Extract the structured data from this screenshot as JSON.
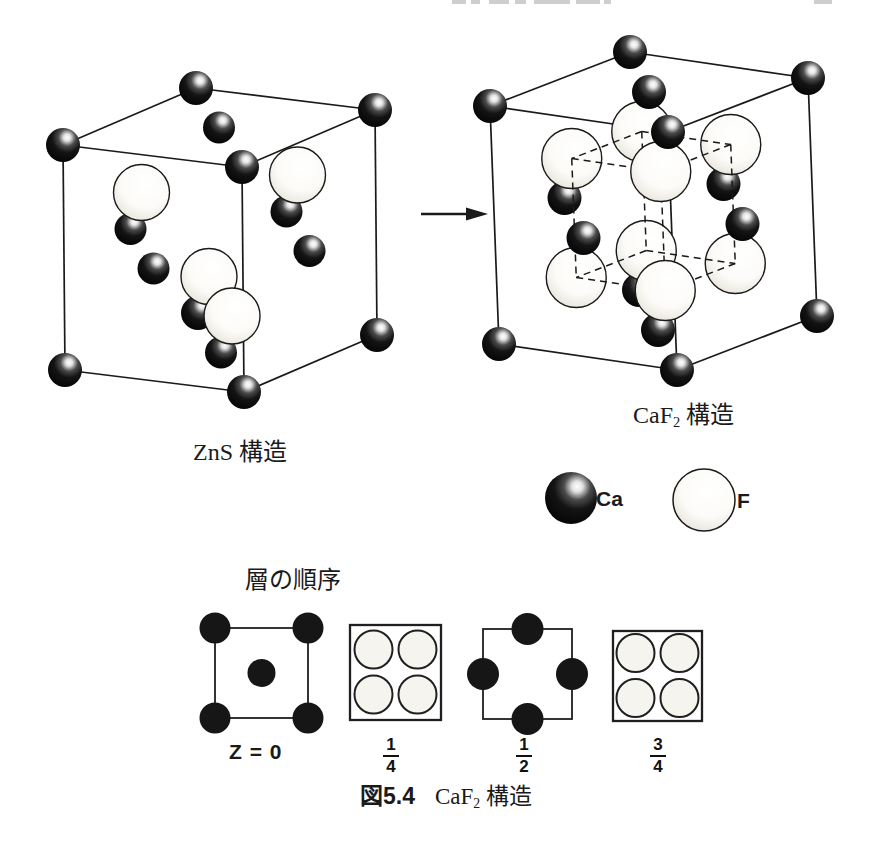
{
  "page": {
    "width": 875,
    "height": 846,
    "bg": "#ffffff",
    "ink": "#1a1a1a"
  },
  "labels": {
    "zns": "ZnS 構造",
    "caf2": {
      "pre": "CaF",
      "sub": "2",
      "post": " 構造"
    }
  },
  "arrow": {
    "x1": 421,
    "y1": 214,
    "x2": 488,
    "y2": 214
  },
  "structures": [
    {
      "id": "zns",
      "origin": [
        196,
        88
      ],
      "u": [
        179,
        22
      ],
      "v": [
        -133,
        57
      ],
      "w": [
        2,
        225
      ],
      "r_corner": 17,
      "r_face": 16,
      "r_light": 28,
      "light_sites": [
        [
          0.25,
          0.75,
          0.25
        ],
        [
          0.75,
          0.25,
          0.25
        ],
        [
          0.25,
          0.25,
          0.75
        ],
        [
          0.75,
          0.75,
          0.75
        ]
      ],
      "dashed_inner": false
    },
    {
      "id": "caf2",
      "origin": [
        630,
        52
      ],
      "u": [
        178,
        26
      ],
      "v": [
        -140,
        54
      ],
      "w": [
        9,
        238
      ],
      "r_corner": 17,
      "r_face": 17,
      "r_light": 30,
      "light_sites": [
        [
          0.25,
          0.25,
          0.25
        ],
        [
          0.75,
          0.25,
          0.25
        ],
        [
          0.25,
          0.75,
          0.25
        ],
        [
          0.75,
          0.75,
          0.25
        ],
        [
          0.25,
          0.25,
          0.75
        ],
        [
          0.75,
          0.25,
          0.75
        ],
        [
          0.25,
          0.75,
          0.75
        ],
        [
          0.75,
          0.75,
          0.75
        ]
      ],
      "dashed_inner": true
    }
  ],
  "legend": {
    "items": [
      {
        "symbol": "Ca",
        "type": "dark",
        "cx": 571,
        "cy": 498,
        "r": 26
      },
      {
        "symbol": "F",
        "type": "light",
        "cx": 704,
        "cy": 500,
        "r": 31
      }
    ]
  },
  "layers": {
    "heading": "層の順序",
    "items": [
      {
        "kind": "dark-corners-center",
        "label": "Z = 0",
        "square": [
          215,
          628,
          93,
          90
        ],
        "r": 15.5,
        "r_center": 14
      },
      {
        "kind": "light-quad",
        "frac": {
          "num": "1",
          "den": "4"
        },
        "square": [
          350,
          625,
          91,
          95
        ],
        "r": 19
      },
      {
        "kind": "dark-edges",
        "frac": {
          "num": "1",
          "den": "2"
        },
        "square": [
          483,
          629,
          89,
          90
        ],
        "r": 16
      },
      {
        "kind": "light-quad",
        "frac": {
          "num": "3",
          "den": "4"
        },
        "square": [
          613,
          631,
          89,
          90
        ],
        "r": 19
      }
    ]
  },
  "caption": {
    "fig": "図5.4",
    "pre": "CaF",
    "sub": "2",
    "post": " 構造"
  },
  "scan_marks": [
    {
      "x": 452,
      "w": 14
    },
    {
      "x": 471,
      "w": 9
    },
    {
      "x": 489,
      "w": 20
    },
    {
      "x": 515,
      "w": 11
    },
    {
      "x": 534,
      "w": 36
    },
    {
      "x": 576,
      "w": 24
    },
    {
      "x": 604,
      "w": 7
    },
    {
      "x": 814,
      "w": 18
    }
  ]
}
